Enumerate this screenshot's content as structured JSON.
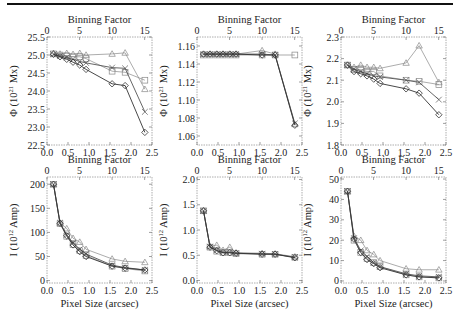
{
  "figure": {
    "top_axis_label": "Binning Factor",
    "bottom_axis_label": "Pixel Size (arcsec)",
    "x_ticks": [
      "0.0",
      "0.5",
      "1.0",
      "1.5",
      "2.0",
      "2.5"
    ],
    "x_tick_values": [
      0.0,
      0.5,
      1.0,
      1.5,
      2.0,
      2.5
    ],
    "top_ticks": [
      "0",
      "5",
      "10",
      "15"
    ],
    "top_tick_values": [
      0,
      5,
      10,
      15
    ],
    "arcsec_per_bin": 0.155,
    "line_color": "#333333",
    "light_line_color": "#888888"
  },
  "chart_data": [
    {
      "type": "line",
      "panel": "top-left",
      "title": "",
      "xlabel": "Pixel Size (arcsec)",
      "top_xlabel": "Binning Factor",
      "ylabel": "Φ (10²¹ Mx)",
      "ylabel_main": "Φ (10",
      "ylabel_sup": "21",
      "ylabel_tail": " Mx)",
      "xlim": [
        0,
        2.5
      ],
      "ylim": [
        22.5,
        25.5
      ],
      "y_ticks": [
        "25.5",
        "25.0",
        "24.5",
        "24.0",
        "23.5",
        "23.0",
        "22.5"
      ],
      "y_tick_values": [
        25.5,
        25.0,
        24.5,
        24.0,
        23.5,
        23.0,
        22.5
      ],
      "x": [
        0.155,
        0.31,
        0.47,
        0.62,
        0.78,
        0.93,
        1.55,
        1.86,
        2.33
      ],
      "series": [
        {
          "name": "triangle",
          "marker": "triangle",
          "values": [
            25.05,
            25.03,
            25.05,
            25.02,
            25.05,
            25.0,
            25.03,
            25.06,
            24.05
          ],
          "color": "#888888"
        },
        {
          "name": "square",
          "marker": "square",
          "values": [
            25.03,
            25.0,
            24.98,
            24.95,
            24.95,
            24.9,
            24.55,
            24.52,
            24.3
          ],
          "color": "#888888"
        },
        {
          "name": "cross",
          "marker": "cross",
          "values": [
            25.02,
            24.97,
            24.93,
            24.88,
            24.82,
            24.78,
            24.65,
            24.63,
            23.42
          ],
          "color": "#555555"
        },
        {
          "name": "diamond",
          "marker": "diamond",
          "values": [
            25.02,
            24.95,
            24.88,
            24.8,
            24.72,
            24.6,
            24.2,
            24.15,
            22.85
          ],
          "color": "#333333"
        }
      ]
    },
    {
      "type": "line",
      "panel": "top-middle",
      "title": "",
      "xlabel": "Pixel Size (arcsec)",
      "top_xlabel": "Binning Factor",
      "ylabel": "Φ (10²¹ Mx)",
      "ylabel_main": "Φ (10",
      "ylabel_sup": "21",
      "ylabel_tail": " Mx)",
      "xlim": [
        0,
        2.5
      ],
      "ylim": [
        1.05,
        1.17
      ],
      "y_ticks": [
        "1.16",
        "1.14",
        "1.12",
        "1.10",
        "1.08",
        "1.06"
      ],
      "y_tick_values": [
        1.16,
        1.14,
        1.12,
        1.1,
        1.08,
        1.06
      ],
      "x": [
        0.155,
        0.31,
        0.47,
        0.62,
        0.78,
        0.93,
        1.55,
        1.86,
        2.33
      ],
      "series": [
        {
          "name": "triangle",
          "marker": "triangle",
          "values": [
            1.151,
            1.151,
            1.151,
            1.151,
            1.151,
            1.151,
            1.155,
            1.151,
            1.073
          ],
          "color": "#888888"
        },
        {
          "name": "square",
          "marker": "square",
          "values": [
            1.15,
            1.15,
            1.15,
            1.15,
            1.15,
            1.15,
            1.15,
            1.15,
            1.15
          ],
          "color": "#888888"
        },
        {
          "name": "cross",
          "marker": "cross",
          "values": [
            1.151,
            1.151,
            1.151,
            1.151,
            1.151,
            1.151,
            1.151,
            1.15,
            1.074
          ],
          "color": "#555555"
        },
        {
          "name": "diamond",
          "marker": "diamond",
          "values": [
            1.151,
            1.151,
            1.151,
            1.151,
            1.151,
            1.151,
            1.15,
            1.15,
            1.072
          ],
          "color": "#333333"
        }
      ]
    },
    {
      "type": "line",
      "panel": "top-right",
      "title": "",
      "xlabel": "Pixel Size (arcsec)",
      "top_xlabel": "Binning Factor",
      "ylabel": "Φ (10²¹ Mx)",
      "ylabel_main": "Φ (10",
      "ylabel_sup": "21",
      "ylabel_tail": " Mx)",
      "xlim": [
        0,
        2.5
      ],
      "ylim": [
        1.8,
        2.3
      ],
      "y_ticks": [
        "2.3",
        "2.2",
        "2.1",
        "2.0",
        "1.9",
        "1.8"
      ],
      "y_tick_values": [
        2.3,
        2.2,
        2.1,
        2.0,
        1.9,
        1.8
      ],
      "x": [
        0.155,
        0.31,
        0.47,
        0.62,
        0.78,
        0.93,
        1.55,
        1.86,
        2.33
      ],
      "series": [
        {
          "name": "triangle",
          "marker": "triangle",
          "values": [
            2.17,
            2.16,
            2.17,
            2.16,
            2.16,
            2.155,
            2.18,
            2.26,
            2.09
          ],
          "color": "#888888"
        },
        {
          "name": "square",
          "marker": "square",
          "values": [
            2.17,
            2.15,
            2.15,
            2.14,
            2.14,
            2.12,
            2.1,
            2.095,
            2.08
          ],
          "color": "#888888"
        },
        {
          "name": "cross",
          "marker": "cross",
          "values": [
            2.17,
            2.15,
            2.14,
            2.13,
            2.12,
            2.115,
            2.1,
            2.09,
            2.01
          ],
          "color": "#555555"
        },
        {
          "name": "diamond",
          "marker": "diamond",
          "values": [
            2.17,
            2.14,
            2.13,
            2.12,
            2.105,
            2.085,
            2.06,
            2.04,
            1.94
          ],
          "color": "#333333"
        }
      ]
    },
    {
      "type": "line",
      "panel": "bottom-left",
      "title": "",
      "xlabel": "Pixel Size (arcsec)",
      "top_xlabel": "Binning Factor",
      "ylabel": "I (10¹² Amp)",
      "ylabel_main": "I (10",
      "ylabel_sup": "12",
      "ylabel_tail": " Amp)",
      "xlim": [
        0,
        2.5
      ],
      "ylim": [
        -5,
        215
      ],
      "y_ticks": [
        "200",
        "150",
        "100",
        "50",
        "0"
      ],
      "y_tick_values": [
        200,
        150,
        100,
        50,
        0
      ],
      "x": [
        0.155,
        0.31,
        0.47,
        0.62,
        0.78,
        0.93,
        1.55,
        1.86,
        2.33
      ],
      "series": [
        {
          "name": "triangle",
          "marker": "triangle",
          "values": [
            200,
            120,
            108,
            88,
            80,
            65,
            45,
            40,
            38
          ],
          "color": "#888888"
        },
        {
          "name": "square",
          "marker": "square",
          "values": [
            200,
            118,
            92,
            75,
            62,
            52,
            30,
            25,
            20
          ],
          "color": "#888888"
        },
        {
          "name": "cross",
          "marker": "cross",
          "values": [
            200,
            120,
            95,
            78,
            65,
            55,
            32,
            27,
            22
          ],
          "color": "#555555"
        },
        {
          "name": "diamond",
          "marker": "diamond",
          "values": [
            200,
            119,
            93,
            74,
            60,
            50,
            30,
            26,
            22
          ],
          "color": "#333333"
        }
      ]
    },
    {
      "type": "line",
      "panel": "bottom-middle",
      "title": "",
      "xlabel": "Pixel Size (arcsec)",
      "top_xlabel": "Binning Factor",
      "ylabel": "I (10¹² Amp)",
      "ylabel_main": "I (10",
      "ylabel_sup": "12",
      "ylabel_tail": " Amp)",
      "xlim": [
        0,
        2.5
      ],
      "ylim": [
        -0.05,
        2.05
      ],
      "y_ticks": [
        "2.0",
        "1.5",
        "1.0",
        "0.5",
        "0.0"
      ],
      "y_tick_values": [
        2.0,
        1.5,
        1.0,
        0.5,
        0.0
      ],
      "x": [
        0.155,
        0.31,
        0.47,
        0.62,
        0.78,
        0.93,
        1.55,
        1.86,
        2.33
      ],
      "series": [
        {
          "name": "triangle",
          "marker": "triangle",
          "values": [
            1.38,
            0.68,
            0.7,
            0.6,
            0.66,
            0.55,
            0.54,
            0.53,
            0.47
          ],
          "color": "#888888"
        },
        {
          "name": "square",
          "marker": "square",
          "values": [
            1.38,
            0.66,
            0.58,
            0.55,
            0.55,
            0.53,
            0.52,
            0.52,
            0.46
          ],
          "color": "#888888"
        },
        {
          "name": "cross",
          "marker": "cross",
          "values": [
            1.38,
            0.67,
            0.6,
            0.56,
            0.56,
            0.54,
            0.53,
            0.52,
            0.46
          ],
          "color": "#555555"
        },
        {
          "name": "diamond",
          "marker": "diamond",
          "values": [
            1.38,
            0.66,
            0.59,
            0.55,
            0.55,
            0.54,
            0.52,
            0.52,
            0.45
          ],
          "color": "#333333"
        }
      ]
    },
    {
      "type": "line",
      "panel": "bottom-right",
      "title": "",
      "xlabel": "Pixel Size (arcsec)",
      "top_xlabel": "Binning Factor",
      "ylabel": "I (10¹² Amp)",
      "ylabel_main": "I (10",
      "ylabel_sup": "12",
      "ylabel_tail": " Amp)",
      "xlim": [
        0,
        2.5
      ],
      "ylim": [
        -1,
        51
      ],
      "y_ticks": [
        "50",
        "40",
        "30",
        "20",
        "10",
        "0"
      ],
      "y_tick_values": [
        50,
        40,
        30,
        20,
        10,
        0
      ],
      "x": [
        0.155,
        0.31,
        0.47,
        0.62,
        0.78,
        0.93,
        1.55,
        1.86,
        2.33
      ],
      "series": [
        {
          "name": "triangle",
          "marker": "triangle",
          "values": [
            44,
            22,
            20,
            15,
            13,
            10,
            6,
            5.5,
            5.5
          ],
          "color": "#888888"
        },
        {
          "name": "square",
          "marker": "square",
          "values": [
            44,
            20,
            14,
            11,
            9,
            7,
            3,
            2,
            1.5
          ],
          "color": "#888888"
        },
        {
          "name": "cross",
          "marker": "cross",
          "values": [
            44,
            21,
            15,
            12,
            9,
            7,
            3.5,
            2.5,
            2
          ],
          "color": "#555555"
        },
        {
          "name": "diamond",
          "marker": "diamond",
          "values": [
            44,
            20.5,
            14,
            10.5,
            8.5,
            6.5,
            3,
            2,
            1.5
          ],
          "color": "#333333"
        }
      ]
    }
  ]
}
